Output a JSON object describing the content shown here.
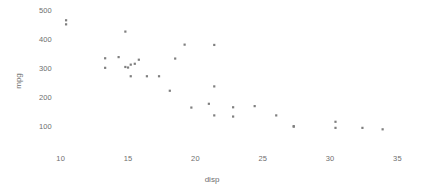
{
  "chart_data": {
    "type": "scatter",
    "title": "",
    "xlabel": "disp",
    "ylabel": "mpg",
    "xlim": [
      8.5,
      36.0
    ],
    "ylim": [
      60,
      520
    ],
    "grid": false,
    "legend": null,
    "x_ticks": [
      10,
      15,
      20,
      25,
      30,
      35
    ],
    "x_tick_labels": [
      "10",
      "15",
      "20",
      "25",
      "30",
      "35"
    ],
    "y_ticks": [
      100,
      200,
      300,
      400,
      500
    ],
    "y_tick_labels": [
      "100",
      "200",
      "300",
      "400",
      "500"
    ],
    "marker": {
      "shape": "square",
      "color": "#7f7f7f",
      "size": 2.2
    },
    "point_count": 32,
    "points": [
      {
        "x": 10.4,
        "y": 468
      },
      {
        "x": 10.4,
        "y": 454
      },
      {
        "x": 14.8,
        "y": 429
      },
      {
        "x": 19.2,
        "y": 384
      },
      {
        "x": 21.4,
        "y": 383
      },
      {
        "x": 13.3,
        "y": 337
      },
      {
        "x": 14.3,
        "y": 341
      },
      {
        "x": 15.8,
        "y": 332
      },
      {
        "x": 18.5,
        "y": 336
      },
      {
        "x": 13.3,
        "y": 304
      },
      {
        "x": 15.2,
        "y": 315
      },
      {
        "x": 14.8,
        "y": 307
      },
      {
        "x": 15.0,
        "y": 305
      },
      {
        "x": 15.5,
        "y": 318
      },
      {
        "x": 15.2,
        "y": 275
      },
      {
        "x": 16.4,
        "y": 275
      },
      {
        "x": 17.3,
        "y": 275
      },
      {
        "x": 18.1,
        "y": 225
      },
      {
        "x": 21.4,
        "y": 240
      },
      {
        "x": 19.7,
        "y": 167
      },
      {
        "x": 21.0,
        "y": 180
      },
      {
        "x": 21.4,
        "y": 140
      },
      {
        "x": 22.8,
        "y": 168
      },
      {
        "x": 22.8,
        "y": 136
      },
      {
        "x": 24.4,
        "y": 172
      },
      {
        "x": 26.0,
        "y": 140
      },
      {
        "x": 27.3,
        "y": 103
      },
      {
        "x": 27.3,
        "y": 101
      },
      {
        "x": 30.4,
        "y": 118
      },
      {
        "x": 30.4,
        "y": 97
      },
      {
        "x": 32.4,
        "y": 97
      },
      {
        "x": 33.9,
        "y": 92
      }
    ]
  },
  "axis_color": "#6e6e6e"
}
